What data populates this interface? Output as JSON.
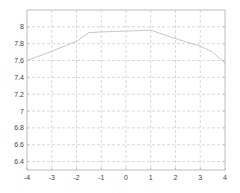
{
  "chart_data": {
    "type": "line",
    "title": "",
    "xlabel": "",
    "ylabel": "",
    "xlim": [
      -4,
      4
    ],
    "ylim": [
      6.3,
      8.2
    ],
    "grid": true,
    "legend": null,
    "x_ticks": [
      -4,
      -3,
      -2,
      -1,
      0,
      1,
      2,
      3,
      4
    ],
    "x_tick_labels": [
      "-4",
      "-3",
      "-2",
      "-1",
      "0",
      "1",
      "2",
      "3",
      "4"
    ],
    "y_ticks": [
      6.4,
      6.6,
      6.8,
      7,
      7.2,
      7.4,
      7.6,
      7.8,
      8
    ],
    "y_tick_labels": [
      "6.4",
      "6.6",
      "6.8",
      "7",
      "7.2",
      "7.4",
      "7.6",
      "7.8",
      "8"
    ],
    "series": [
      {
        "name": "line",
        "color": "#c8c8c8",
        "x": [
          -4,
          -3,
          -2,
          -1.5,
          -1,
          0,
          1,
          2,
          3,
          3.5,
          4
        ],
        "y": [
          7.6,
          7.71,
          7.83,
          7.93,
          7.94,
          7.95,
          7.96,
          7.86,
          7.77,
          7.7,
          7.57
        ]
      }
    ]
  },
  "colors": {
    "axes": "#bdbdbd",
    "grid": "#cfcfcf",
    "tick_text": "#444444",
    "background": "#ffffff"
  }
}
